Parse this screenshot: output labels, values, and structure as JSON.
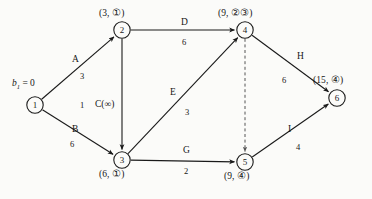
{
  "diagram": {
    "source_label": {
      "var": "b",
      "sub": "1",
      "eq": " = 0"
    },
    "nodes": [
      {
        "id": "1",
        "num": "1",
        "x": 35,
        "y": 105,
        "label": "",
        "label_x": 0,
        "label_y": 0
      },
      {
        "id": "2",
        "num": "2",
        "x": 122,
        "y": 30,
        "label": "(3, ①)",
        "label_x": 99,
        "label_y": 9
      },
      {
        "id": "3",
        "num": "3",
        "x": 122,
        "y": 160,
        "label": "(6, ①)",
        "label_x": 99,
        "label_y": 170
      },
      {
        "id": "4",
        "num": "4",
        "x": 245,
        "y": 30,
        "label": "(9, ②③)",
        "label_x": 218,
        "label_y": 9
      },
      {
        "id": "5",
        "num": "5",
        "x": 245,
        "y": 162,
        "label": "(9, ④)",
        "label_x": 224,
        "label_y": 172
      },
      {
        "id": "6",
        "num": "6",
        "x": 337,
        "y": 98,
        "label": "(15, ④)",
        "label_x": 313,
        "label_y": 76
      }
    ],
    "edges": [
      {
        "id": "A",
        "name": "A",
        "cost": "3",
        "from": "1",
        "to": "2",
        "dashed": false,
        "name_x": 72,
        "name_y": 55,
        "cost_x": 80,
        "cost_y": 72
      },
      {
        "id": "B",
        "name": "B",
        "cost": "6",
        "from": "1",
        "to": "3",
        "dashed": false,
        "name_x": 72,
        "name_y": 125,
        "cost_x": 70,
        "cost_y": 140
      },
      {
        "id": "C",
        "name": "C(∞)",
        "cost": "1",
        "from": "2",
        "to": "3",
        "dashed": false,
        "name_x": 95,
        "name_y": 100,
        "cost_x": 80,
        "cost_y": 101
      },
      {
        "id": "D",
        "name": "D",
        "cost": "6",
        "from": "2",
        "to": "4",
        "dashed": false,
        "name_x": 181,
        "name_y": 18,
        "cost_x": 182,
        "cost_y": 38
      },
      {
        "id": "E",
        "name": "E",
        "cost": "3",
        "from": "3",
        "to": "4",
        "dashed": false,
        "name_x": 170,
        "name_y": 88,
        "cost_x": 185,
        "cost_y": 108
      },
      {
        "id": "G",
        "name": "G",
        "cost": "2",
        "from": "3",
        "to": "5",
        "dashed": false,
        "name_x": 183,
        "name_y": 146,
        "cost_x": 184,
        "cost_y": 167
      },
      {
        "id": "H",
        "name": "H",
        "cost": "6",
        "from": "4",
        "to": "6",
        "dashed": false,
        "name_x": 297,
        "name_y": 52,
        "cost_x": 282,
        "cost_y": 76
      },
      {
        "id": "I",
        "name": "I",
        "cost": "4",
        "from": "5",
        "to": "6",
        "dashed": false,
        "name_x": 288,
        "name_y": 125,
        "cost_x": 296,
        "cost_y": 143
      },
      {
        "id": "F",
        "name": "",
        "cost": "",
        "from": "4",
        "to": "5",
        "dashed": true,
        "name_x": 0,
        "name_y": 0,
        "cost_x": 0,
        "cost_y": 0
      }
    ],
    "colors": {
      "ink": "#1a1a1a",
      "paper": "#fbfbf9",
      "dashed": "#555555"
    }
  }
}
